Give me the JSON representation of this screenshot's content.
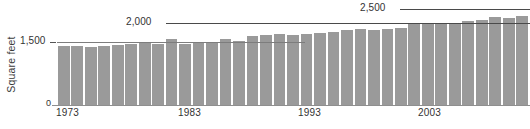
{
  "chart_data": {
    "type": "bar",
    "title": "",
    "subtitle": "",
    "xlabel": "",
    "ylabel": "Square feet",
    "ylim": [
      0,
      2620
    ],
    "grid": true,
    "legend": null,
    "y_ticks": [
      {
        "value": 1500,
        "label": "1,500"
      },
      {
        "value": 2000,
        "label": "2,000"
      },
      {
        "value": 2500,
        "label": "2,500"
      }
    ],
    "baseline_label": "0",
    "x_tick_labels": [
      "1973",
      "1983",
      "1993",
      "2003"
    ],
    "categories": [
      "1973",
      "1974",
      "1975",
      "1976",
      "1977",
      "1978",
      "1979",
      "1980",
      "1981",
      "1982",
      "1983",
      "1984",
      "1985",
      "1986",
      "1987",
      "1988",
      "1989",
      "1990",
      "1991",
      "1992",
      "1993",
      "1994",
      "1995",
      "1996",
      "1997",
      "1998",
      "1999",
      "2000",
      "2001",
      "2002",
      "2003",
      "2004",
      "2005",
      "2006",
      "2007"
    ],
    "values": [
      1525,
      1520,
      1505,
      1530,
      1545,
      1585,
      1645,
      1595,
      1700,
      1590,
      1610,
      1645,
      1705,
      1665,
      1780,
      1810,
      1830,
      1815,
      1835,
      1870,
      1905,
      1945,
      1965,
      1955,
      1975,
      2005,
      2100,
      2125,
      2140,
      2100,
      2180,
      2200,
      2280,
      2250,
      2300
    ],
    "bar_color": "#9a9a9a",
    "axis_color": "#4a4a4a",
    "text_color": "#333333"
  }
}
